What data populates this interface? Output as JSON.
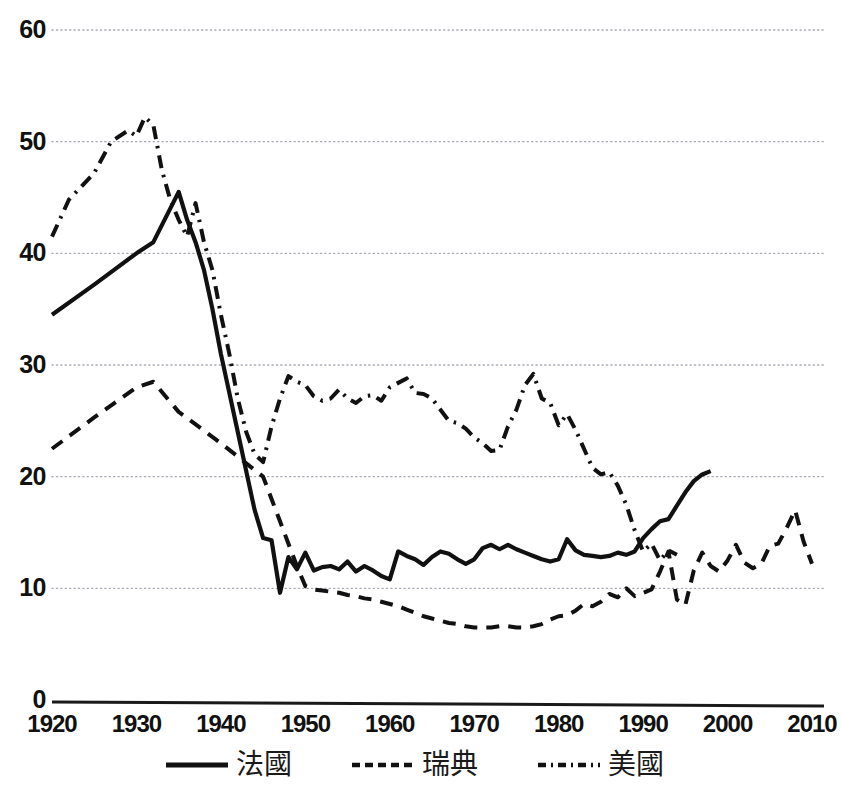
{
  "chart_data": {
    "type": "line",
    "title": "",
    "subtitle": "",
    "xlabel": "",
    "ylabel": "",
    "xlim": [
      1920,
      2010
    ],
    "ylim": [
      0,
      60
    ],
    "grid": true,
    "grid_axis": "y",
    "legend_position": "bottom",
    "yticks": [
      0,
      10,
      20,
      30,
      40,
      50,
      60
    ],
    "ytick_labels": [
      "0",
      "10",
      "20",
      "30",
      "40",
      "50",
      "60"
    ],
    "xticks": [
      1920,
      1930,
      1940,
      1950,
      1960,
      1970,
      1980,
      1990,
      2000,
      2010
    ],
    "xtick_labels": [
      "1920",
      "1930",
      "1940",
      "1950",
      "1960",
      "1970",
      "1980",
      "1990",
      "2000",
      "2010"
    ],
    "series": [
      {
        "name": "法國",
        "style": "solid",
        "color": "#111111",
        "x": [
          1920,
          1925,
          1930,
          1932,
          1933,
          1934,
          1935,
          1936,
          1937,
          1938,
          1939,
          1940,
          1941,
          1942,
          1943,
          1944,
          1945,
          1946,
          1947,
          1948,
          1949,
          1950,
          1951,
          1952,
          1953,
          1954,
          1955,
          1956,
          1957,
          1958,
          1959,
          1960,
          1961,
          1962,
          1963,
          1964,
          1965,
          1966,
          1967,
          1968,
          1969,
          1970,
          1971,
          1972,
          1973,
          1974,
          1975,
          1976,
          1977,
          1978,
          1979,
          1980,
          1981,
          1982,
          1983,
          1984,
          1985,
          1986,
          1987,
          1988,
          1989,
          1990,
          1991,
          1992,
          1993,
          1994,
          1995,
          1996,
          1997,
          1998
        ],
        "values": [
          34.5,
          37.2,
          40.0,
          41.0,
          42.5,
          44.0,
          45.5,
          43.0,
          41.0,
          38.5,
          35.0,
          31.0,
          27.5,
          24.0,
          20.5,
          17.0,
          14.5,
          14.3,
          9.6,
          12.8,
          11.7,
          13.2,
          11.6,
          11.9,
          12.0,
          11.7,
          12.4,
          11.5,
          12.0,
          11.6,
          11.1,
          10.8,
          13.3,
          12.9,
          12.6,
          12.1,
          12.8,
          13.3,
          13.1,
          12.6,
          12.2,
          12.6,
          13.6,
          13.9,
          13.5,
          13.9,
          13.5,
          13.2,
          12.9,
          12.6,
          12.4,
          12.6,
          14.4,
          13.4,
          13.0,
          12.9,
          12.8,
          12.9,
          13.2,
          13.0,
          13.3,
          14.5,
          15.3,
          16.0,
          16.2,
          17.4,
          18.6,
          19.6,
          20.2,
          20.5
        ],
        "start_value": 34.5,
        "peak": {
          "x": 1935,
          "y": 45.5
        },
        "trough": {
          "x": 1947,
          "y": 9.6
        },
        "end_value": 20.5
      },
      {
        "name": "瑞典",
        "style": "dashed",
        "color": "#111111",
        "x": [
          1920,
          1925,
          1930,
          1932,
          1935,
          1940,
          1945,
          1946,
          1947,
          1948,
          1949,
          1950,
          1951,
          1952,
          1953,
          1954,
          1955,
          1956,
          1957,
          1958,
          1959,
          1960,
          1961,
          1962,
          1963,
          1964,
          1965,
          1966,
          1967,
          1968,
          1969,
          1970,
          1971,
          1972,
          1973,
          1974,
          1975,
          1976,
          1977,
          1978,
          1979,
          1980,
          1981,
          1982,
          1983,
          1984,
          1985,
          1986,
          1987,
          1988,
          1989,
          1990,
          1991,
          1992,
          1993,
          1994,
          1995,
          1996,
          1997,
          1998,
          1999,
          2000,
          2001,
          2002,
          2003,
          2004,
          2005,
          2006,
          2007,
          2008,
          2009,
          2010
        ],
        "values": [
          22.5,
          25.3,
          28.0,
          28.5,
          25.8,
          23.0,
          20.0,
          18.0,
          16.0,
          14.0,
          12.0,
          10.2,
          9.9,
          9.8,
          9.7,
          9.6,
          9.4,
          9.3,
          9.1,
          9.0,
          8.8,
          8.6,
          8.4,
          8.1,
          7.8,
          7.5,
          7.3,
          7.1,
          6.9,
          6.8,
          6.6,
          6.5,
          6.5,
          6.5,
          6.6,
          6.6,
          6.5,
          6.5,
          6.6,
          6.8,
          7.2,
          7.5,
          7.6,
          8.0,
          8.6,
          8.4,
          8.8,
          9.5,
          9.2,
          10.0,
          9.3,
          9.6,
          9.9,
          11.5,
          13.3,
          9.0,
          8.5,
          11.6,
          13.2,
          12.0,
          11.5,
          12.5,
          13.9,
          12.3,
          11.8,
          12.2,
          13.8,
          14.0,
          15.4,
          17.0,
          14.2,
          12.2
        ],
        "start_value": 22.5,
        "peak": {
          "x": 1932,
          "y": 28.5
        },
        "trough": {
          "x": 1971,
          "y": 6.5
        },
        "end_value": 12.2
      },
      {
        "name": "美國",
        "style": "dashdot",
        "color": "#111111",
        "x": [
          1920,
          1922,
          1925,
          1927,
          1929,
          1930,
          1931,
          1932,
          1933,
          1934,
          1935,
          1936,
          1937,
          1938,
          1939,
          1940,
          1941,
          1942,
          1943,
          1944,
          1945,
          1946,
          1947,
          1948,
          1949,
          1950,
          1951,
          1952,
          1953,
          1954,
          1955,
          1956,
          1957,
          1958,
          1959,
          1960,
          1961,
          1962,
          1963,
          1964,
          1965,
          1966,
          1967,
          1968,
          1969,
          1970,
          1971,
          1972,
          1973,
          1974,
          1975,
          1976,
          1977,
          1978,
          1979,
          1980,
          1981,
          1982,
          1983,
          1984,
          1985,
          1986,
          1987,
          1988,
          1989,
          1990,
          1991,
          1992,
          1993,
          1994
        ],
        "values": [
          41.5,
          44.8,
          47.2,
          50.0,
          51.0,
          50.5,
          52.2,
          51.5,
          47.5,
          44.8,
          43.0,
          41.5,
          44.5,
          41.0,
          38.5,
          34.5,
          31.0,
          27.0,
          24.0,
          22.0,
          21.3,
          24.5,
          27.0,
          29.0,
          28.5,
          28.2,
          27.2,
          26.8,
          27.0,
          27.8,
          27.0,
          26.6,
          27.2,
          27.3,
          26.8,
          28.0,
          28.4,
          28.8,
          27.5,
          27.4,
          27.0,
          26.0,
          25.0,
          24.8,
          24.3,
          23.5,
          23.0,
          22.3,
          22.4,
          24.5,
          26.0,
          28.2,
          29.2,
          27.0,
          26.6,
          24.6,
          25.6,
          24.2,
          22.5,
          20.8,
          20.2,
          20.4,
          19.2,
          17.5,
          15.2,
          13.3,
          14.0,
          12.5,
          13.4,
          13.0
        ],
        "start_value": 41.5,
        "peak": {
          "x": 1931,
          "y": 52.2
        },
        "end_value": 13.0
      }
    ]
  },
  "legend": {
    "items": [
      {
        "label": "法國",
        "style": "solid"
      },
      {
        "label": "瑞典",
        "style": "dashed"
      },
      {
        "label": "美國",
        "style": "dashdot"
      }
    ]
  },
  "colors": {
    "line": "#111111",
    "grid": "#a9a9b5",
    "axis": "#1a1a1a",
    "background": "#ffffff"
  }
}
